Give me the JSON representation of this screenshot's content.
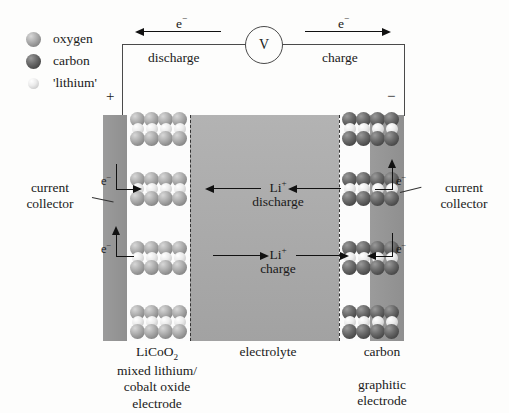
{
  "legend": {
    "items": [
      {
        "label": "oxygen",
        "icon": "oxygen-sphere-icon",
        "color": "#8d8d8d"
      },
      {
        "label": "carbon",
        "icon": "carbon-sphere-icon",
        "color": "#4b4b4b"
      },
      {
        "label": "'lithium'",
        "icon": "lithium-sphere-icon",
        "color": "#e6e6e6"
      }
    ]
  },
  "circuit": {
    "meter_label": "V",
    "left_electron": "e−",
    "right_electron": "e−",
    "left_mode": "discharge",
    "right_mode": "charge",
    "positive_sign": "+",
    "negative_sign": "−"
  },
  "collectors": {
    "left_label": "current\ncollector",
    "left_label_line1": "current",
    "left_label_line2": "collector",
    "right_label_line1": "current",
    "right_label_line2": "collector",
    "electron_symbol": "e−"
  },
  "electrolyte": {
    "label": "electrolyte",
    "discharge_ion": "Li+",
    "discharge_mode": "discharge",
    "charge_ion": "Li+",
    "charge_mode": "charge"
  },
  "electrodes": {
    "left": {
      "formula": "LiCoO2",
      "formula_base": "LiCoO",
      "formula_sub": "2",
      "desc_line1": "mixed lithium/",
      "desc_line2": "cobalt oxide",
      "desc_line3": "electrode",
      "sphere_type": "oxygen",
      "layers": 4
    },
    "right": {
      "name": "carbon",
      "desc_line1": "graphitic",
      "desc_line2": "electrode",
      "sphere_type": "carbon",
      "layers": 4
    }
  },
  "colors": {
    "background": "#fdfdfc",
    "collector": "#949494",
    "electrolyte": "#aaaaaa",
    "electrode": "#fcfcfc",
    "wire": "#4a4a4a",
    "text": "#1a1a1a"
  }
}
